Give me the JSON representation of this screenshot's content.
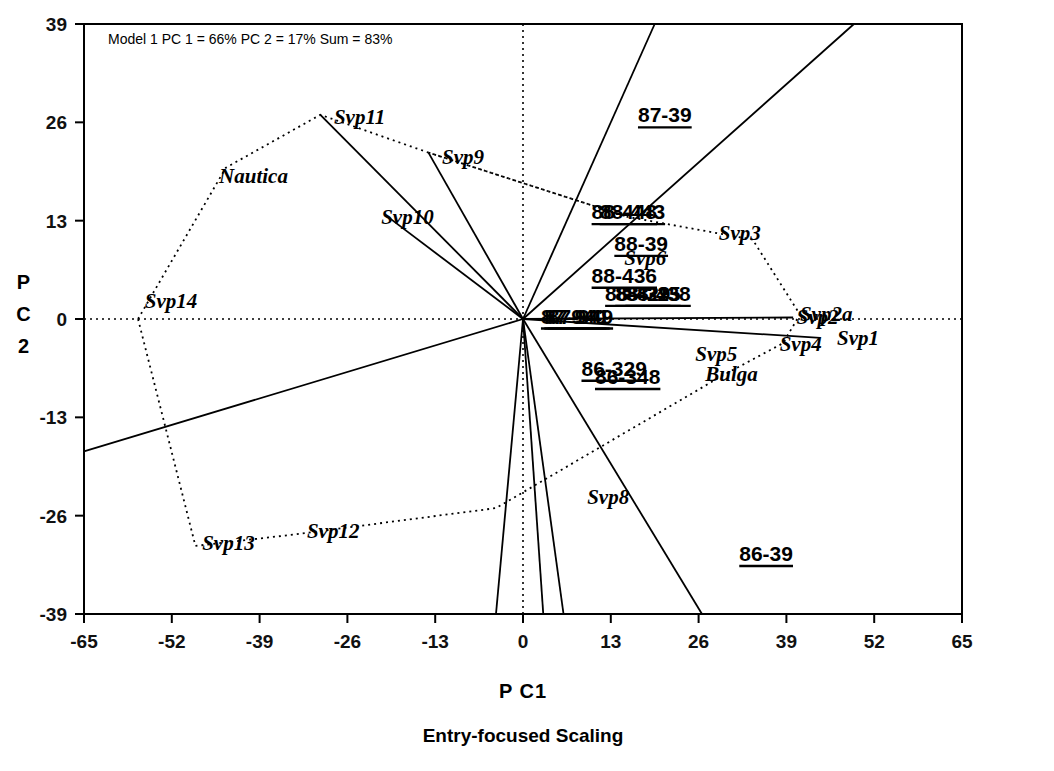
{
  "chart_data": {
    "type": "scatter",
    "title": "",
    "annotation": "Model 1 PC 1 = 66% PC 2 = 17% Sum = 83%",
    "model_info": {
      "model": "Model 1",
      "pc1_variance_pct": 66,
      "pc2_variance_pct": 17,
      "sum_variance_pct": 83
    },
    "xlabel": "P C1",
    "ylabel": "P C 2",
    "subtitle": "Entry-focused Scaling",
    "xlim": [
      -65,
      65
    ],
    "ylim": [
      -39,
      39
    ],
    "xticks": [
      -65,
      -52,
      -39,
      -26,
      -13,
      0,
      13,
      26,
      39,
      52,
      65
    ],
    "yticks": [
      39,
      26,
      13,
      0,
      -13,
      -26,
      -39
    ],
    "grid": false,
    "legend": "none",
    "zero_lines": true,
    "variables": [
      {
        "name": "Svp1",
        "x": 44.0,
        "y": -2.5,
        "lx": 46.5,
        "ly": -3.5
      },
      {
        "name": "Svp2",
        "x": 40.0,
        "y": 0.2,
        "lx": 40.5,
        "ly": -0.6
      },
      {
        "name": "Svp2a",
        "x": 41.0,
        "y": 0.6,
        "lx": 41.0,
        "ly": -0.2
      },
      {
        "name": "Svp3",
        "x": 34.0,
        "y": 10.5,
        "lx": 29.0,
        "ly": 10.4
      },
      {
        "name": "Svp4",
        "x": 38.5,
        "y": -3.2,
        "lx": 38.0,
        "ly": -4.2
      },
      {
        "name": "Svp5",
        "x": 28.5,
        "y": -5.5,
        "lx": 25.5,
        "ly": -5.6
      },
      {
        "name": "Svp6",
        "x": 18.0,
        "y": 7.6,
        "lx": 15.0,
        "ly": 7.2
      },
      {
        "name": "Svp8",
        "x": -4.0,
        "y": -25.0,
        "lx": 9.5,
        "ly": -24.5
      },
      {
        "name": "Svp9",
        "x": -14.0,
        "y": 22.0,
        "lx": -12.0,
        "ly": 20.5
      },
      {
        "name": "Svp10",
        "x": -20.0,
        "y": 13.5,
        "lx": -21.0,
        "ly": 12.5
      },
      {
        "name": "Svp11",
        "x": -30.0,
        "y": 27.0,
        "lx": -28.0,
        "ly": 25.8
      },
      {
        "name": "Svp12",
        "x": -34.0,
        "y": -28.5,
        "lx": -32.0,
        "ly": -29.0
      },
      {
        "name": "Svp13",
        "x": -48.5,
        "y": -30.0,
        "lx": -47.5,
        "ly": -30.5
      },
      {
        "name": "Svp14",
        "x": -57.0,
        "y": 0.0,
        "lx": -56.0,
        "ly": 1.5
      },
      {
        "name": "Nautica",
        "x": -44.0,
        "y": 20.0,
        "lx": -45.0,
        "ly": 18.0
      },
      {
        "name": "Bulga",
        "x": 29.5,
        "y": -7.5,
        "lx": 27.0,
        "ly": -8.2
      }
    ],
    "objects": [
      {
        "name": "87-39",
        "x": 21.0,
        "y": 26.0
      },
      {
        "name": "88-448",
        "x": 15.0,
        "y": 13.2
      },
      {
        "name": "88-443",
        "x": 16.2,
        "y": 13.2
      },
      {
        "name": "88-39",
        "x": 17.5,
        "y": 9.0
      },
      {
        "name": "88-436",
        "x": 15.0,
        "y": 4.8
      },
      {
        "name": "88-438",
        "x": 20.0,
        "y": 2.4
      },
      {
        "name": "88-429",
        "x": 17.0,
        "y": 2.4
      },
      {
        "name": "88-325",
        "x": 18.5,
        "y": 2.4
      },
      {
        "name": "87-940",
        "x": 7.5,
        "y": -0.6
      },
      {
        "name": "87-941",
        "x": 8.0,
        "y": -0.6
      },
      {
        "name": "87-949",
        "x": 8.5,
        "y": -0.6
      },
      {
        "name": "86-329",
        "x": 13.5,
        "y": -7.5
      },
      {
        "name": "86-348",
        "x": 15.5,
        "y": -8.6
      },
      {
        "name": "86-39",
        "x": 36.0,
        "y": -32.0
      }
    ],
    "vectors_from_origin": [
      {
        "name": "Svp11",
        "x": -30.0,
        "y": 27.0
      },
      {
        "name": "Svp9",
        "x": -14.0,
        "y": 22.0
      },
      {
        "name": "Svp10",
        "x": -20.0,
        "y": 13.5
      },
      {
        "name": "Svp14",
        "x": -65.0,
        "y": -17.5
      },
      {
        "name": "Svp3",
        "x": 49.0,
        "y": 39.0
      },
      {
        "name": "Svp6",
        "x": 19.5,
        "y": 39.0
      },
      {
        "name": "Svp1",
        "x": 44.0,
        "y": -2.5
      },
      {
        "name": "Svp2",
        "x": 40.0,
        "y": 0.2
      },
      {
        "name": "Svp8",
        "x": -4.0,
        "y": -39.0
      },
      {
        "name": "Svp5",
        "x": 3.0,
        "y": -39.0
      },
      {
        "name": "Svp4",
        "x": 26.5,
        "y": -39.0
      },
      {
        "name": "Svp7",
        "x": 6.0,
        "y": -39.0
      }
    ],
    "hull_polygon": [
      {
        "x": -57.0,
        "y": 0.0
      },
      {
        "x": -44.0,
        "y": 20.0
      },
      {
        "x": -30.0,
        "y": 27.0
      },
      {
        "x": -14.0,
        "y": 22.0
      },
      {
        "x": 15.5,
        "y": 13.5
      },
      {
        "x": 34.0,
        "y": 10.5
      },
      {
        "x": 41.0,
        "y": 0.6
      },
      {
        "x": 38.5,
        "y": -3.2
      },
      {
        "x": 29.5,
        "y": -7.5
      },
      {
        "x": -4.0,
        "y": -25.0
      },
      {
        "x": -34.0,
        "y": -28.5
      },
      {
        "x": -48.5,
        "y": -30.0
      }
    ]
  }
}
